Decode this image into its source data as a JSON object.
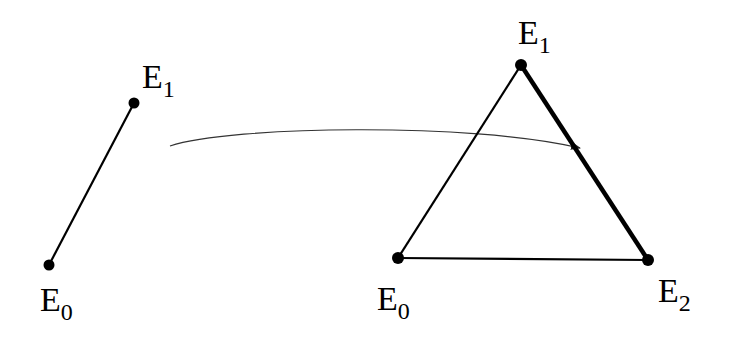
{
  "diagram": {
    "left": {
      "vertices": [
        {
          "name": "E",
          "sub": "0",
          "x": 49,
          "y": 265
        },
        {
          "name": "E",
          "sub": "1",
          "x": 134,
          "y": 103
        }
      ]
    },
    "right": {
      "vertices": [
        {
          "name": "E",
          "sub": "0",
          "x": 398,
          "y": 258
        },
        {
          "name": "E",
          "sub": "1",
          "x": 521,
          "y": 65
        },
        {
          "name": "E",
          "sub": "2",
          "x": 648,
          "y": 260
        }
      ],
      "bold_edge": "E1-E2"
    },
    "labels": {
      "left_e1": {
        "main": "E",
        "sub": "1"
      },
      "left_e0": {
        "main": "E",
        "sub": "0"
      },
      "right_e1": {
        "main": "E",
        "sub": "1"
      },
      "right_e0": {
        "main": "E",
        "sub": "0"
      },
      "right_e2": {
        "main": "E",
        "sub": "2"
      }
    },
    "arrow": "maps segment to edge"
  }
}
